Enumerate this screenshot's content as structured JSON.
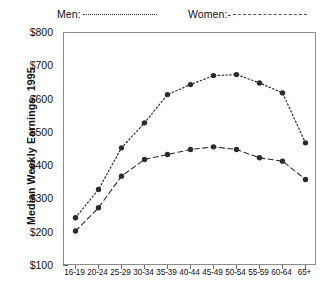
{
  "chart_data": {
    "type": "line",
    "title": "",
    "xlabel": "",
    "ylabel": "Median Weekly Earnings, 1995",
    "ylim": [
      100,
      800
    ],
    "ytick_labels": [
      "$800",
      "$700",
      "$600",
      "$500",
      "$400",
      "$300",
      "$200",
      "$100"
    ],
    "ytick_values": [
      800,
      700,
      600,
      500,
      400,
      300,
      200,
      100
    ],
    "minor_tick_step": 50,
    "grid": false,
    "legend_position": "top",
    "categories": [
      "16-19",
      "20-24",
      "25-29",
      "30-34",
      "35-39",
      "40-44",
      "45-49",
      "50-54",
      "55-59",
      "60-64",
      "65+"
    ],
    "series": [
      {
        "name": "Men:",
        "style": "dotted",
        "marker": "filled-circle",
        "color": "#2b2b2b",
        "values": [
          245,
          330,
          455,
          530,
          615,
          645,
          672,
          675,
          650,
          620,
          470
        ]
      },
      {
        "name": "Women:-",
        "style": "dashed",
        "marker": "filled-circle",
        "color": "#2b2b2b",
        "values": [
          205,
          275,
          370,
          420,
          435,
          450,
          458,
          450,
          425,
          415,
          360
        ]
      }
    ]
  },
  "legend": {
    "men_label": "Men:",
    "women_label": "Women:-"
  },
  "axes": {
    "y_title": "Median Weekly Earnings, 1995"
  }
}
